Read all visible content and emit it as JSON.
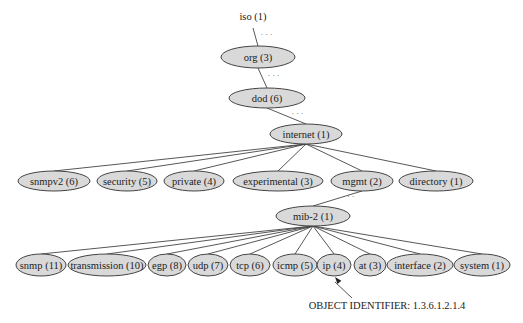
{
  "colors": {
    "node_fill": "#d9d9d9",
    "node_stroke": "#444444",
    "edge": "#444444",
    "background": "#ffffff"
  },
  "root": {
    "id": "iso",
    "label": "iso (1)",
    "x": 253,
    "y": 20
  },
  "nodes": [
    {
      "id": "org",
      "label": "org (3)",
      "cx": 258,
      "cy": 57,
      "rx": 37,
      "ry": 11,
      "parent": "iso",
      "elided": true
    },
    {
      "id": "dod",
      "label": "dod (6)",
      "cx": 267,
      "cy": 98,
      "rx": 38,
      "ry": 10,
      "parent": "org",
      "elided": true
    },
    {
      "id": "internet",
      "label": "internet (1)",
      "cx": 306,
      "cy": 134,
      "rx": 36,
      "ry": 10,
      "parent": "dod",
      "elided": true
    },
    {
      "id": "snmpv2",
      "label": "snmpv2 (6)",
      "cx": 54,
      "cy": 181,
      "rx": 36,
      "ry": 10,
      "parent": "internet"
    },
    {
      "id": "security",
      "label": "security (5)",
      "cx": 127,
      "cy": 181,
      "rx": 30,
      "ry": 10,
      "parent": "internet"
    },
    {
      "id": "private",
      "label": "private (4)",
      "cx": 194,
      "cy": 181,
      "rx": 30,
      "ry": 10,
      "parent": "internet"
    },
    {
      "id": "experimental",
      "label": "experimental (3)",
      "cx": 278,
      "cy": 181,
      "rx": 45,
      "ry": 10,
      "parent": "internet"
    },
    {
      "id": "mgmt",
      "label": "mgmt (2)",
      "cx": 362,
      "cy": 181,
      "rx": 31,
      "ry": 10,
      "parent": "internet"
    },
    {
      "id": "directory",
      "label": "directory (1)",
      "cx": 436,
      "cy": 181,
      "rx": 37,
      "ry": 10,
      "parent": "internet"
    },
    {
      "id": "mib2",
      "label": "mib-2 (1)",
      "cx": 313,
      "cy": 216,
      "rx": 37,
      "ry": 10,
      "parent": "mgmt",
      "elided": true
    },
    {
      "id": "snmp",
      "label": "snmp (11)",
      "cx": 41,
      "cy": 265,
      "rx": 25,
      "ry": 11,
      "parent": "mib2"
    },
    {
      "id": "transmission",
      "label": "transmission (10)",
      "cx": 107,
      "cy": 265,
      "rx": 39,
      "ry": 11,
      "parent": "mib2"
    },
    {
      "id": "egp",
      "label": "egp (8)",
      "cx": 167,
      "cy": 265,
      "rx": 19,
      "ry": 11,
      "parent": "mib2"
    },
    {
      "id": "udp",
      "label": "udp (7)",
      "cx": 208,
      "cy": 265,
      "rx": 20,
      "ry": 11,
      "parent": "mib2"
    },
    {
      "id": "tcp",
      "label": "tcp (6)",
      "cx": 250,
      "cy": 265,
      "rx": 20,
      "ry": 11,
      "parent": "mib2"
    },
    {
      "id": "icmp",
      "label": "icmp (5)",
      "cx": 295,
      "cy": 265,
      "rx": 22,
      "ry": 11,
      "parent": "mib2"
    },
    {
      "id": "ip",
      "label": "ip (4)",
      "cx": 334,
      "cy": 265,
      "rx": 17,
      "ry": 11,
      "parent": "mib2"
    },
    {
      "id": "at",
      "label": "at (3)",
      "cx": 370,
      "cy": 265,
      "rx": 16,
      "ry": 11,
      "parent": "mib2"
    },
    {
      "id": "interface",
      "label": "interface (2)",
      "cx": 420,
      "cy": 265,
      "rx": 33,
      "ry": 11,
      "parent": "mib2"
    },
    {
      "id": "system",
      "label": "system (1)",
      "cx": 482,
      "cy": 265,
      "rx": 28,
      "ry": 11,
      "parent": "mib2"
    }
  ],
  "elided_marker": "· · ·",
  "annotation": {
    "label": "OBJECT IDENTIFIER: 1.3.6.1.2.1.4",
    "x": 387,
    "y": 309,
    "arrow_from": {
      "x": 352,
      "y": 298
    },
    "arrow_to": {
      "x": 335,
      "y": 277
    }
  }
}
